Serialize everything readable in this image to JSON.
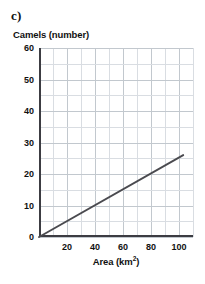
{
  "figure": {
    "part_label": "c)"
  },
  "chart_data": {
    "type": "line",
    "title": "",
    "xlabel_text": "Area (km",
    "xlabel_sup": "2",
    "xlabel_tail": ")",
    "xlabel": "Area (km2)",
    "ylabel": "Camels (number)",
    "xlim": [
      0,
      110
    ],
    "ylim": [
      0,
      60
    ],
    "xticks": [
      0,
      20,
      40,
      60,
      80,
      100
    ],
    "xtick_labels": [
      "",
      "20",
      "40",
      "60",
      "80",
      "100"
    ],
    "yticks": [
      0,
      10,
      20,
      30,
      40,
      50,
      60
    ],
    "ytick_labels": [
      "0",
      "10",
      "20",
      "30",
      "40",
      "50",
      "60"
    ],
    "x_minor_step": 10,
    "y_minor_step": 5,
    "grid": true,
    "legend": false,
    "line_color": "#4a4a4f",
    "grid_color": "#d9dde2",
    "axis_color": "#3c3c42",
    "series": [
      {
        "name": "Camels vs Area",
        "points": [
          [
            0,
            0
          ],
          [
            103,
            26
          ]
        ],
        "slope": 0.25,
        "intercept": 0
      }
    ]
  }
}
